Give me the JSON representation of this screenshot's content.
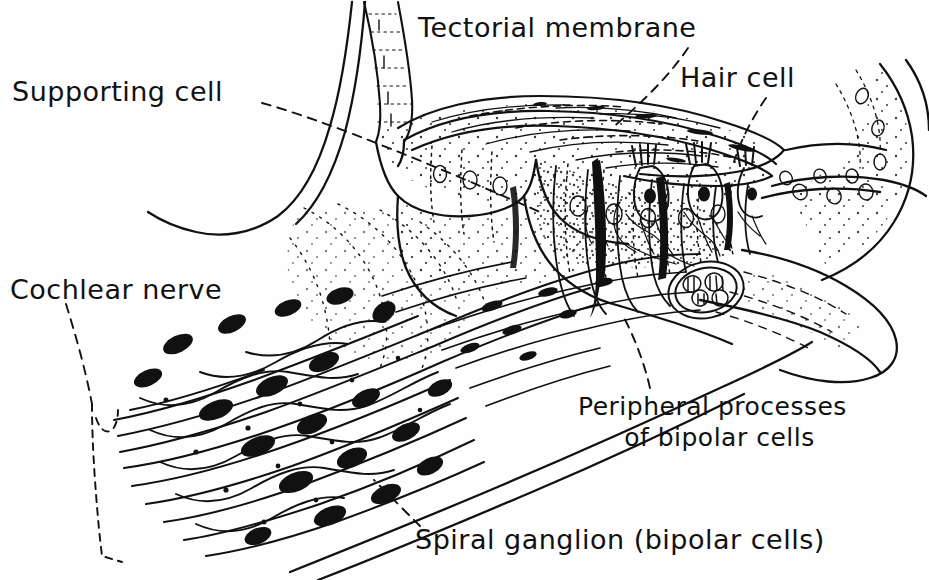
{
  "figure": {
    "kind": "anatomical-line-drawing",
    "style": "pen-and-ink hatched / stippled medical illustration",
    "background_color": "#fefefe",
    "ink_color": "#111111",
    "width": 929,
    "height": 580
  },
  "labels": {
    "supporting_cell": "Supporting cell",
    "tectorial_membrane": "Tectorial membrane",
    "hair_cell": "Hair cell",
    "cochlear_nerve": "Cochlear nerve",
    "peripheral_processes_line1": "Peripheral processes",
    "peripheral_processes_line2": "of bipolar cells",
    "spiral_ganglion": "Spiral ganglion (bipolar cells)"
  },
  "leaders": {
    "supporting_cell": "dashed line running down-right from label into the stippled supporting-cell region",
    "tectorial_membrane": "dashed line running down-left from label to the tectorial membrane flap",
    "hair_cell": "dashed line running down-left from label to a hair cell in the organ of Corti",
    "cochlear_nerve": "dashed line curving down from label to a tall dashed bracket spanning the nerve fibre bundle",
    "peripheral_processes": "dashed line running up-left from label to the peripheral nerve processes",
    "spiral_ganglion": "dashed line running up-left from label to a filled bipolar cell body"
  }
}
